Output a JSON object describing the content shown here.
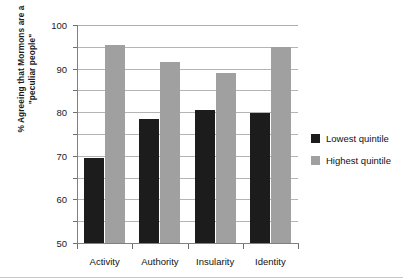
{
  "chart_data": {
    "type": "bar",
    "title": "",
    "subtitle": "",
    "xlabel": "",
    "ylabel": "% Agreeing that Mormons are a \"peculiar people\"",
    "ylabel_lines": [
      "% Agreeing that Mormons are a",
      "\"peculiar people\""
    ],
    "categories": [
      "Activity",
      "Authority",
      "Insularity",
      "Identity"
    ],
    "series": [
      {
        "name": "Lowest quintile",
        "color": "#1c1c1c",
        "values": [
          39,
          57,
          61,
          59.5
        ]
      },
      {
        "name": "Highest quintile",
        "color": "#a0a0a0",
        "values": [
          91,
          83,
          78,
          90
        ]
      }
    ],
    "ylim": [
      0,
      100
    ],
    "ytick_values": [
      0,
      10,
      20,
      30,
      40,
      50,
      60,
      70,
      80,
      90,
      100
    ],
    "ytick_labels": [
      "0",
      "10",
      "20",
      "30",
      "40",
      "50",
      "60",
      "70",
      "80",
      "90",
      "100"
    ],
    "grid": true,
    "grid_axis": "y",
    "legend_position": "right",
    "legend": [
      {
        "label": "Lowest quintile",
        "color": "#1c1c1c"
      },
      {
        "label": "Highest quintile",
        "color": "#a0a0a0"
      }
    ]
  }
}
